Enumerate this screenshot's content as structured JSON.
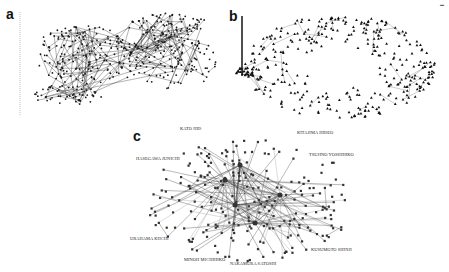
{
  "figure": {
    "panels": [
      {
        "letter": "a",
        "description": "dense co-authorship network with ruler-like legend column at left"
      },
      {
        "letter": "b",
        "description": "ring-shaped network of triangle nodes with legend column at left"
      },
      {
        "letter": "c",
        "description": "labeled author network"
      }
    ],
    "panel_c_labels": [
      "KATO HID",
      "KITAJIMA HIDEO",
      "HASEGAWA JUNICHI",
      "TSUJINO YOSHIHIKO",
      "URAHAMA KIICHI",
      "KUSUMOTO SHINJI",
      "MINOH MICHIHIKO",
      "NAKAMURA SATOSHI"
    ],
    "colors": {
      "background": "#ffffff",
      "edge": "#333333",
      "node": "#1a1a1a",
      "light_edge": "#999999"
    }
  }
}
